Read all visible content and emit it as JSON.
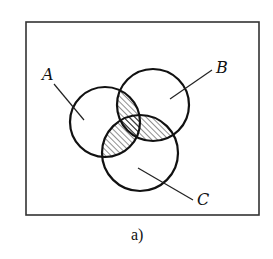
{
  "figure": {
    "caption": "a)",
    "type": "venn-diagram",
    "colors": {
      "stroke": "#111111",
      "background": "#ffffff",
      "hatch": "#222222"
    },
    "universe": {
      "x": 26,
      "y": 22,
      "width": 233,
      "height": 193
    },
    "sets": [
      {
        "name": "A",
        "label": "A",
        "cx": 105,
        "cy": 122,
        "r": 35,
        "label_pos": {
          "x": 42,
          "y": 80
        },
        "leader": {
          "x1": 54,
          "y1": 84,
          "x2": 84,
          "y2": 120
        }
      },
      {
        "name": "B",
        "label": "B",
        "cx": 153,
        "cy": 105,
        "r": 36,
        "label_pos": {
          "x": 216,
          "y": 73
        },
        "leader": {
          "x1": 212,
          "y1": 70,
          "x2": 170,
          "y2": 99
        }
      },
      {
        "name": "C",
        "label": "C",
        "cx": 140,
        "cy": 153,
        "r": 38,
        "label_pos": {
          "x": 197,
          "y": 205
        },
        "leader": {
          "x1": 138,
          "y1": 168,
          "x2": 193,
          "y2": 200
        }
      }
    ],
    "shaded_regions": [
      "A∩B",
      "B∩C",
      "A∩C"
    ],
    "hatch": {
      "angle_deg": 45,
      "spacing_px": 4
    }
  }
}
